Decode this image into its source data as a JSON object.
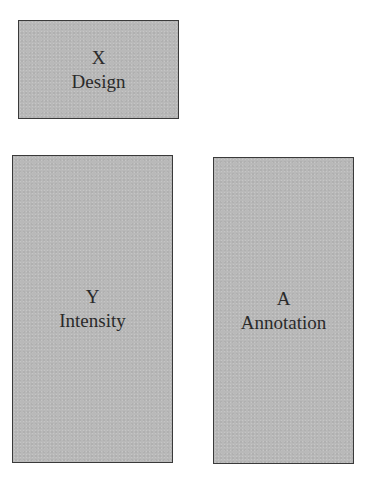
{
  "diagram": {
    "boxes": [
      {
        "id": "x",
        "symbol": "X",
        "label": "Design"
      },
      {
        "id": "y",
        "symbol": "Y",
        "label": "Intensity"
      },
      {
        "id": "a",
        "symbol": "A",
        "label": "Annotation"
      }
    ]
  },
  "colors": {
    "box_fill": "#b9b9b9",
    "box_border": "#3a3a3a",
    "text": "#2a2a2a",
    "background": "#ffffff"
  }
}
